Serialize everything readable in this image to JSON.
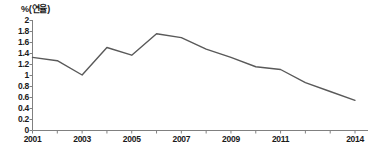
{
  "chart_data": {
    "type": "line",
    "title": "",
    "subtitle": "",
    "ylabel": "%(연율)",
    "xlabel": "",
    "ylim": [
      0,
      2
    ],
    "xlim": [
      2001,
      2014
    ],
    "grid": false,
    "legend": null,
    "legend_position": "none",
    "line_color": "#595959",
    "x": [
      2001,
      2002,
      2003,
      2004,
      2005,
      2006,
      2007,
      2008,
      2009,
      2010,
      2011,
      2012,
      2013,
      2014
    ],
    "values": [
      1.32,
      1.26,
      1.0,
      1.5,
      1.36,
      1.75,
      1.68,
      1.47,
      1.32,
      1.15,
      1.1,
      0.86,
      0.7,
      0.54
    ],
    "ytick_labels": [
      "2",
      "1.8",
      "1.6",
      "1.4",
      "1.2",
      "1",
      "0.8",
      "0.6",
      "0.4",
      "0.2",
      "0"
    ],
    "ytick_values": [
      2,
      1.8,
      1.6,
      1.4,
      1.2,
      1,
      0.8,
      0.6,
      0.4,
      0.2,
      0
    ],
    "xtick_labels": [
      "2001",
      "2003",
      "2005",
      "2007",
      "2009",
      "2011",
      "2014"
    ],
    "xtick_values": [
      2001,
      2003,
      2005,
      2007,
      2009,
      2011,
      2014
    ],
    "xtick_minor_values": [
      2002,
      2004,
      2006,
      2008,
      2010,
      2012,
      2013
    ]
  }
}
